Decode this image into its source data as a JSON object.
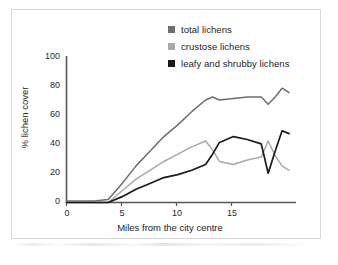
{
  "chart_data": {
    "type": "line",
    "title": "",
    "subtitle": "",
    "xlabel": "Miles from the city centre",
    "ylabel": "% lichen cover",
    "xlim": [
      0,
      16.5
    ],
    "ylim": [
      0,
      100
    ],
    "xticks": [
      0,
      5,
      10,
      15
    ],
    "yticks": [
      0,
      20,
      40,
      60,
      80,
      100
    ],
    "grid": false,
    "legend_position": "top-right",
    "series": [
      {
        "name": "total lichens",
        "color": "#6e6e6e",
        "x": [
          0,
          1,
          2,
          3,
          4,
          5,
          6,
          7,
          8,
          9,
          10,
          10.5,
          11,
          12,
          13,
          14,
          14.5,
          15,
          15.5,
          16
        ],
        "values": [
          1,
          1,
          1,
          2,
          13,
          25,
          35,
          45,
          53,
          62,
          70,
          72,
          70,
          71,
          72,
          72,
          67,
          72,
          78,
          75
        ]
      },
      {
        "name": "crustose lichens",
        "color": "#a9a9a9",
        "x": [
          0,
          1,
          2,
          3,
          4,
          5,
          6,
          7,
          8,
          9,
          10,
          10.5,
          11,
          12,
          13,
          14,
          14.5,
          15,
          15.5,
          16
        ],
        "values": [
          0,
          0,
          0,
          0,
          8,
          16,
          22,
          28,
          33,
          38,
          42,
          36,
          28,
          26,
          29,
          31,
          42,
          32,
          25,
          22
        ]
      },
      {
        "name": "leafy and shrubby lichens",
        "color": "#1a1a1a",
        "x": [
          0,
          1,
          2,
          3,
          4,
          5,
          6,
          7,
          8,
          9,
          10,
          10.5,
          11,
          12,
          13,
          14,
          14.5,
          15,
          15.5,
          16
        ],
        "values": [
          0,
          0,
          0,
          0,
          4,
          9,
          13,
          17,
          19,
          22,
          26,
          33,
          41,
          45,
          43,
          40,
          20,
          35,
          49,
          47
        ]
      }
    ]
  },
  "legend": {
    "items": [
      {
        "label": "total lichens",
        "color": "#6e6e6e"
      },
      {
        "label": "crustose lichens",
        "color": "#a9a9a9"
      },
      {
        "label": "leafy and shrubby lichens",
        "color": "#1a1a1a"
      }
    ]
  },
  "axes": {
    "y_tick_labels": [
      "100",
      "80",
      "60",
      "40",
      "20",
      "0"
    ],
    "x_tick_labels": [
      "0",
      "5",
      "10",
      "15"
    ],
    "y_axis_title": "% lichen cover",
    "x_axis_title": "Miles from the city centre"
  }
}
